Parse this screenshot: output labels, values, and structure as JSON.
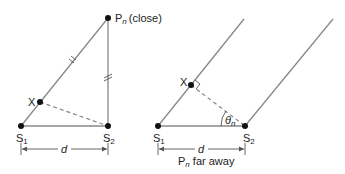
{
  "diagram": {
    "left_panel": {
      "point_pn_label": "P",
      "point_pn_sub": "n",
      "point_pn_note": "(close)",
      "point_x_label": "X",
      "point_s1_label": "S",
      "point_s1_sub": "1",
      "point_s2_label": "S",
      "point_s2_sub": "2",
      "distance_label": "d"
    },
    "right_panel": {
      "point_x_label": "X",
      "point_s1_label": "S",
      "point_s1_sub": "1",
      "point_s2_label": "S",
      "point_s2_sub": "2",
      "angle_label": "θ",
      "angle_sub": "n",
      "distance_label": "d",
      "caption_p": "P",
      "caption_sub": "n",
      "caption_rest": " far away"
    },
    "colors": {
      "line": "#888888",
      "point": "#111111",
      "text": "#222222"
    }
  }
}
